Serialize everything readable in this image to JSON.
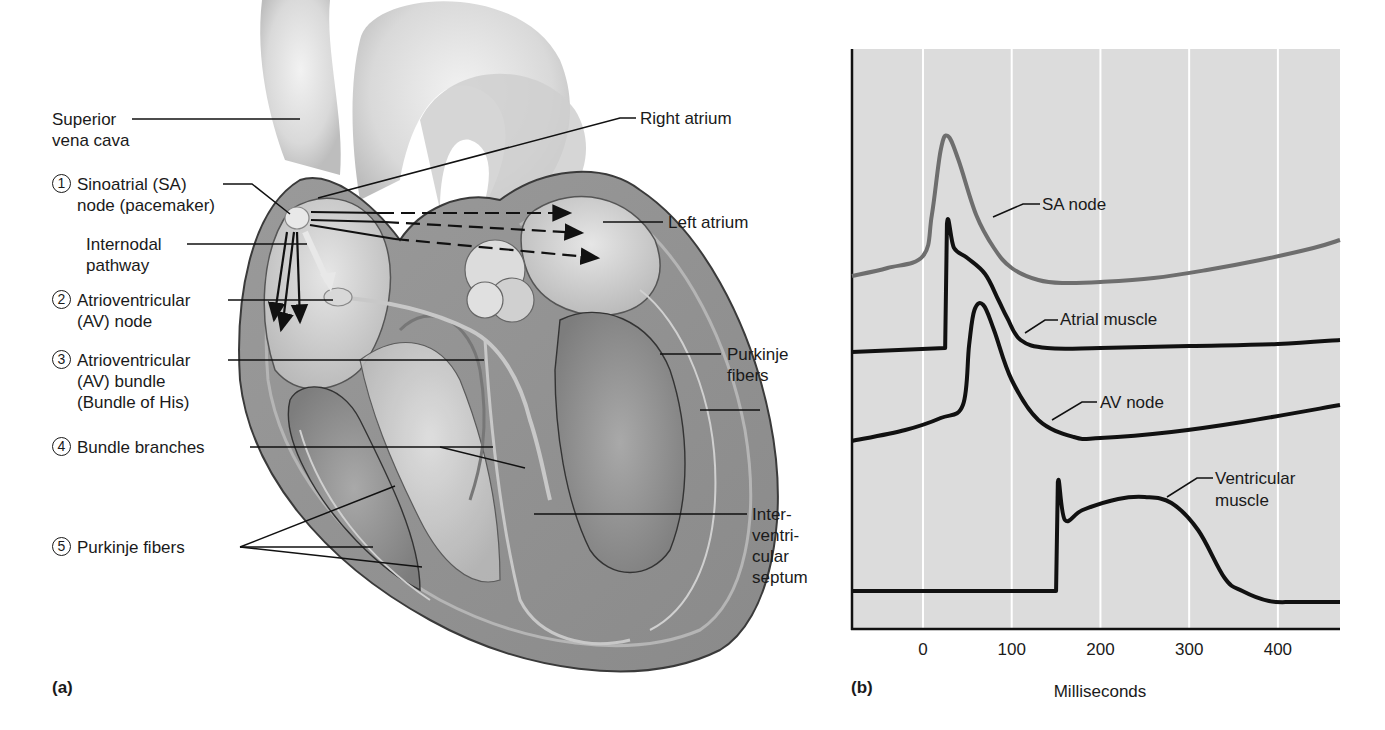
{
  "panel_a": {
    "tag": "(a)",
    "labels": {
      "superior_vena_cava": [
        "Superior",
        "vena cava"
      ],
      "sa_node": {
        "number": "1",
        "lines": [
          "Sinoatrial (SA)",
          "node (pacemaker)"
        ]
      },
      "internodal_pathway": [
        "Internodal",
        "pathway"
      ],
      "av_node": {
        "number": "2",
        "lines": [
          "Atrioventricular",
          "(AV) node"
        ]
      },
      "av_bundle": {
        "number": "3",
        "lines": [
          "Atrioventricular",
          "(AV) bundle",
          "(Bundle of His)"
        ]
      },
      "bundle_branches": {
        "number": "4",
        "lines": [
          "Bundle branches"
        ]
      },
      "purkinje_left": {
        "number": "5",
        "lines": [
          "Purkinje fibers"
        ]
      },
      "right_atrium": "Right atrium",
      "left_atrium": "Left atrium",
      "purkinje_right": [
        "Purkinje",
        "fibers"
      ],
      "interventricular_septum": [
        "Inter-",
        "ventri-",
        "cular",
        "septum"
      ]
    }
  },
  "panel_b": {
    "tag": "(b)"
  },
  "chart_data": {
    "type": "line",
    "title": "",
    "xlabel": "Milliseconds",
    "ylabel": "",
    "xlim": [
      -80,
      470
    ],
    "xticks": [
      0,
      100,
      200,
      300,
      400
    ],
    "xtick_labels": [
      "0",
      "100",
      "200",
      "300",
      "400"
    ],
    "grid": "vertical",
    "legend": "inline labels",
    "series": [
      {
        "name": "SA node",
        "color": "#6e6e6e",
        "x": [
          -80,
          -40,
          0,
          10,
          20,
          28,
          40,
          60,
          80,
          100,
          130,
          160,
          200,
          260,
          320,
          380,
          440,
          470
        ],
        "y_px": [
          276,
          268,
          256,
          215,
          150,
          136,
          160,
          215,
          248,
          268,
          280,
          283,
          282,
          278,
          270,
          260,
          248,
          240
        ]
      },
      {
        "name": "Atrial muscle",
        "color": "#111111",
        "x": [
          -80,
          25,
          25,
          27,
          35,
          50,
          70,
          85,
          95,
          110,
          140,
          200,
          300,
          400,
          470
        ],
        "y_px": [
          352,
          348,
          348,
          224,
          248,
          258,
          274,
          300,
          318,
          340,
          348,
          348,
          346,
          344,
          340
        ],
        "note": "Vertical depolarization at ~25 ms, plateau decay returning to baseline by ~130 ms"
      },
      {
        "name": "AV node",
        "color": "#111111",
        "x": [
          -80,
          -20,
          20,
          45,
          52,
          58,
          68,
          80,
          100,
          130,
          170,
          200,
          280,
          360,
          470
        ],
        "y_px": [
          441,
          430,
          418,
          405,
          345,
          310,
          305,
          330,
          380,
          420,
          437,
          438,
          432,
          422,
          405
        ]
      },
      {
        "name": "Ventricular muscle",
        "color": "#111111",
        "x": [
          -80,
          150,
          150,
          152,
          160,
          180,
          220,
          250,
          280,
          310,
          340,
          360,
          390,
          420,
          470
        ],
        "y_px": [
          591,
          591,
          591,
          482,
          520,
          510,
          499,
          497,
          503,
          530,
          578,
          591,
          601,
          602,
          602
        ],
        "note": "Resting until ~150 ms, spike then plateau peaking ~250 ms, repolarization ~340-380 ms"
      }
    ]
  }
}
